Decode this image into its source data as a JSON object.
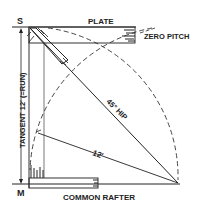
{
  "diagram": {
    "labels": {
      "top_point": "S",
      "bottom_point": "M",
      "plate": "PLATE",
      "zero_pitch": "ZERO PITCH",
      "tangent": "TANGENT 12' (=RUN)",
      "hip": "45° HIP",
      "radius": "12'",
      "common_rafter": "COMMON RAFTER"
    },
    "colors": {
      "ink": "#222222",
      "background": "#ffffff"
    }
  }
}
